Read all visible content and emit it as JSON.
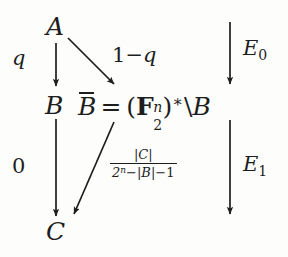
{
  "diagram": {
    "type": "commutative-diagram",
    "title": "",
    "nodes": [
      {
        "id": "A",
        "label": "A",
        "position": "top-left"
      },
      {
        "id": "B",
        "label": "B",
        "position": "middle-left"
      },
      {
        "id": "C",
        "label": "C",
        "position": "bottom-left"
      },
      {
        "id": "Bbar",
        "position": "middle-center",
        "expression": {
          "lhs_base": "B",
          "lhs_accent": "overbar",
          "equals": "=",
          "open_paren": "(",
          "field_symbol": "F",
          "field_blackboard": "F",
          "superscript": "n",
          "subscript": "2",
          "close_paren": ")",
          "star": "∗",
          "backslash": "\\",
          "rhs": "B",
          "plain_text": "B̄ = (𝔽₂ⁿ)*\\B"
        }
      }
    ],
    "edges": [
      {
        "id": "a-to-b",
        "from": "A",
        "to": "B",
        "label": "q",
        "style": "vertical-arrow"
      },
      {
        "id": "a-to-bbar",
        "from": "A",
        "to": "Bbar",
        "label_parts": {
          "one": "1",
          "minus": "−",
          "q": "q"
        },
        "label": "1−q",
        "style": "diagonal-arrow"
      },
      {
        "id": "b-to-c",
        "from": "B",
        "to": "C",
        "label": "0",
        "style": "vertical-arrow"
      },
      {
        "id": "bbar-to-c",
        "from": "Bbar",
        "to": "C",
        "style": "diagonal-arrow",
        "label_fraction": {
          "numerator": "|C|",
          "denominator_base": "2",
          "denominator_exponent": "n",
          "denominator_rest_1": "−",
          "denominator_rest_2": "|B|",
          "denominator_rest_3": "−",
          "denominator_rest_4": "1",
          "plain_text": "|C| / (2ⁿ−|B|−1)"
        }
      },
      {
        "id": "e0-arrow",
        "label_base": "E",
        "label_sub": "0",
        "label": "E0",
        "style": "vertical-arrow",
        "position": "right-top"
      },
      {
        "id": "e1-arrow",
        "label_base": "E",
        "label_sub": "1",
        "label": "E1",
        "style": "vertical-arrow",
        "position": "right-bottom"
      }
    ],
    "colors": {
      "ink": "#1d1d1d",
      "background": "#fdfdfc"
    }
  }
}
